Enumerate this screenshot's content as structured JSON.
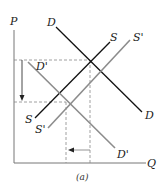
{
  "diagram": {
    "caption": "(a)",
    "axes": {
      "y_label": "P",
      "x_label": "Q"
    },
    "curves": {
      "demand": {
        "label_top": "D",
        "label_bottom": "D",
        "color": "#111111"
      },
      "supply": {
        "label_top": "S",
        "label_bottom": "S",
        "color": "#111111"
      },
      "supply_new": {
        "label_top": "S'",
        "label_bottom": "S'",
        "color": "#8c8c8c"
      },
      "demand_new": {
        "label_top": "D'",
        "label_bottom": "D'",
        "color": "#8c8c8c"
      }
    },
    "annotations": {
      "price_shift_arrow": "down",
      "quantity_shift_arrow": "left"
    }
  }
}
